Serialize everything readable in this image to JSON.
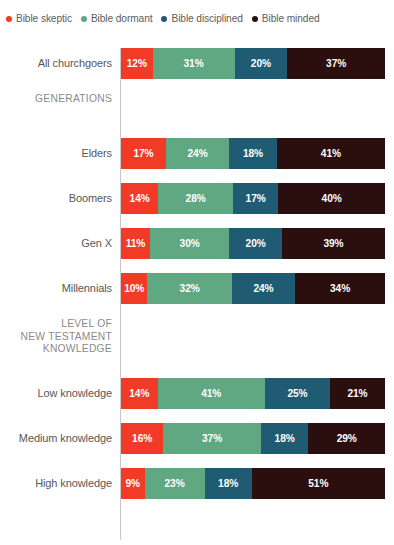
{
  "legend": {
    "position": "top-left",
    "items": [
      {
        "label": "Bible skeptic",
        "color": "#f23b26",
        "icon": "legend-dot-icon"
      },
      {
        "label": "Bible dormant",
        "color": "#5fa882",
        "icon": "legend-dot-icon"
      },
      {
        "label": "Bible disciplined",
        "color": "#1f5c73",
        "icon": "legend-dot-icon"
      },
      {
        "label": "Bible minded",
        "color": "#2b0e0e",
        "icon": "legend-dot-icon"
      }
    ]
  },
  "rows": [
    {
      "type": "bar",
      "label": "All churchgoers",
      "values": [
        12,
        31,
        20,
        37
      ],
      "labels": [
        "12%",
        "31%",
        "20%",
        "37%"
      ]
    },
    {
      "type": "heading",
      "label": "GENERATIONS"
    },
    {
      "type": "bar",
      "label": "Elders",
      "values": [
        17,
        24,
        18,
        41
      ],
      "labels": [
        "17%",
        "24%",
        "18%",
        "41%"
      ]
    },
    {
      "type": "bar",
      "label": "Boomers",
      "values": [
        14,
        28,
        17,
        40
      ],
      "labels": [
        "14%",
        "28%",
        "17%",
        "40%"
      ]
    },
    {
      "type": "bar",
      "label": "Gen X",
      "values": [
        11,
        30,
        20,
        39
      ],
      "labels": [
        "11%",
        "30%",
        "20%",
        "39%"
      ]
    },
    {
      "type": "bar",
      "label": "Millennials",
      "values": [
        10,
        32,
        24,
        34
      ],
      "labels": [
        "10%",
        "32%",
        "24%",
        "34%"
      ]
    },
    {
      "type": "heading",
      "label": "LEVEL OF\nNEW TESTAMENT\nKNOWLEDGE"
    },
    {
      "type": "bar",
      "label": "Low knowledge",
      "values": [
        14,
        41,
        25,
        21
      ],
      "labels": [
        "14%",
        "41%",
        "25%",
        "21%"
      ]
    },
    {
      "type": "bar",
      "label": "Medium knowledge",
      "values": [
        16,
        37,
        18,
        29
      ],
      "labels": [
        "16%",
        "37%",
        "18%",
        "29%"
      ]
    },
    {
      "type": "bar",
      "label": "High knowledge",
      "values": [
        9,
        23,
        18,
        51
      ],
      "labels": [
        "9%",
        "23%",
        "18%",
        "51%"
      ]
    }
  ],
  "chart_data": {
    "type": "bar",
    "orientation": "horizontal",
    "stacked": true,
    "normalized": true,
    "title": "",
    "subtitle": "",
    "xlabel": "",
    "ylabel": "",
    "xlim": [
      0,
      100
    ],
    "grid": false,
    "legend_position": "top-left",
    "value_unit": "percent",
    "series": [
      {
        "name": "Bible skeptic",
        "color": "#f23b26",
        "values": [
          12,
          17,
          14,
          11,
          10,
          14,
          16,
          9
        ]
      },
      {
        "name": "Bible dormant",
        "color": "#5fa882",
        "values": [
          31,
          24,
          28,
          30,
          32,
          41,
          37,
          23
        ]
      },
      {
        "name": "Bible disciplined",
        "color": "#1f5c73",
        "values": [
          20,
          18,
          17,
          20,
          24,
          25,
          18,
          18
        ]
      },
      {
        "name": "Bible minded",
        "color": "#2b0e0e",
        "values": [
          37,
          41,
          40,
          39,
          34,
          21,
          29,
          51
        ]
      }
    ],
    "categories": [
      "All churchgoers",
      "Elders",
      "Boomers",
      "Gen X",
      "Millennials",
      "Low knowledge",
      "Medium knowledge",
      "High knowledge"
    ],
    "category_groups": [
      {
        "heading": "",
        "categories": [
          "All churchgoers"
        ]
      },
      {
        "heading": "GENERATIONS",
        "categories": [
          "Elders",
          "Boomers",
          "Gen X",
          "Millennials"
        ]
      },
      {
        "heading": "LEVEL OF NEW TESTAMENT KNOWLEDGE",
        "categories": [
          "Low knowledge",
          "Medium knowledge",
          "High knowledge"
        ]
      }
    ],
    "annotations": []
  }
}
